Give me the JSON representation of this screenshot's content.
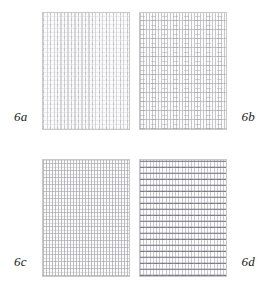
{
  "figure": {
    "layout": "2x2",
    "background_color": "#ffffff",
    "panels": [
      {
        "id": "6a",
        "label": "6a",
        "label_position": "bottom-left",
        "border_color": "#c9c9c9",
        "fill_color": "#fbfbfb",
        "weave_color": "#b9b9be",
        "description": "fine dense vertical warp with faint dashed weft",
        "warp_spacing_px": 3.5,
        "weft_spacing_px": 4,
        "density": "very-fine",
        "contrast": "lightest"
      },
      {
        "id": "6b",
        "label": "6b",
        "label_position": "bottom-right",
        "border_color": "#c9c9c9",
        "fill_color": "#fbfbfb",
        "weave_color": "#afafb6",
        "description": "dense vertical warp crossed by widely spaced horizontal weft bands",
        "warp_spacing_px": 3,
        "weft_spacing_px": 9,
        "density": "fine",
        "contrast": "light"
      },
      {
        "id": "6c",
        "label": "6c",
        "label_position": "bottom-left",
        "border_color": "#c9c9c9",
        "fill_color": "#fbfbfb",
        "weave_color": "#acacb4",
        "description": "regular tight grid of vertical and horizontal yarns",
        "warp_spacing_px": 3,
        "weft_spacing_px": 7,
        "density": "medium",
        "contrast": "medium"
      },
      {
        "id": "6d",
        "label": "6d",
        "label_position": "bottom-right",
        "border_color": "#c9c9c9",
        "fill_color": "#fbfbfb",
        "weave_color": "#787882",
        "description": "pronounced horizontal banding over vertical warp, densest weave",
        "warp_spacing_px": 3.2,
        "weft_spacing_px": 6,
        "density": "dense",
        "contrast": "darkest"
      }
    ]
  }
}
